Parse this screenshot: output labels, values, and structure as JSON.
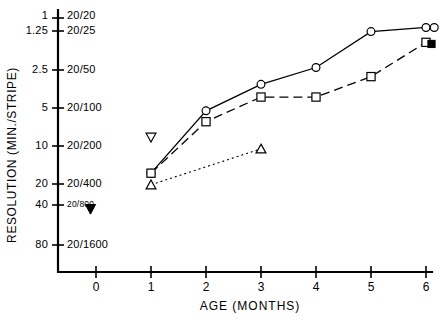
{
  "chart_data": {
    "type": "line",
    "title": "",
    "xlabel": "AGE  (MONTHS)",
    "ylabel": "RESOLUTION (MIN./STRIPE)",
    "xlim": [
      -0.45,
      6.25
    ],
    "ylim_log_minstripe": [
      1,
      80
    ],
    "grid": false,
    "legend": "none",
    "x_ticks": [
      "0",
      "1",
      "2",
      "3",
      "4",
      "5",
      "6"
    ],
    "x_tick_values": [
      0,
      1,
      2,
      3,
      4,
      5,
      6
    ],
    "y_ticks_left": [
      "1",
      "1.25",
      "2.5",
      "5",
      "10",
      "20",
      "40",
      "80"
    ],
    "y_tick_values": [
      1,
      1.25,
      2.5,
      5,
      10,
      20,
      40,
      80
    ],
    "y_ticks_right": [
      "20/20",
      "20/25",
      "20/50",
      "20/100",
      "20/200",
      "20/400",
      "20/800",
      "20/1600"
    ],
    "series": [
      {
        "name": "circle-series",
        "marker": "open-circle",
        "line": "solid",
        "x": [
          1,
          2,
          3,
          4,
          5,
          6
        ],
        "values": [
          20,
          6.0,
          3.6,
          2.6,
          1.3,
          1.2
        ]
      },
      {
        "name": "square-series",
        "marker": "open-square",
        "line": "dashed",
        "x": [
          1,
          2,
          3,
          4,
          5,
          6
        ],
        "values": [
          20,
          7.4,
          4.6,
          4.6,
          3.1,
          1.6
        ]
      },
      {
        "name": "triangle-series",
        "marker": "open-triangle",
        "line": "dotted",
        "x": [
          1,
          3
        ],
        "values": [
          25,
          12.5
        ]
      }
    ],
    "annotations": [
      {
        "name": "open-inverted-triangle-marker",
        "marker": "open-inverted-triangle",
        "x": 1,
        "value": 10
      },
      {
        "name": "filled-inverted-triangle-marker",
        "marker": "filled-inverted-triangle",
        "x": -0.1,
        "value": 40
      },
      {
        "name": "overlapping-circle-marker",
        "marker": "open-circle",
        "x": 6.15,
        "value": 1.2
      },
      {
        "name": "filled-square-marker",
        "marker": "filled-square",
        "x": 6.1,
        "value": 1.65
      }
    ]
  }
}
